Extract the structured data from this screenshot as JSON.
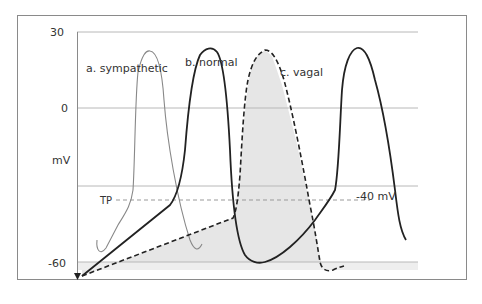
{
  "figure": {
    "y_axis": {
      "unit_label": "mV",
      "ticks": [
        "30",
        "0",
        "-60"
      ]
    },
    "reference_lines": {
      "threshold_label": "TP",
      "threshold_value_label": "-40 mV"
    },
    "curves": [
      {
        "id": "a",
        "label": "a. sympathetic",
        "style": "thin solid grey"
      },
      {
        "id": "b",
        "label": "b. normal",
        "style": "thick solid black"
      },
      {
        "id": "c",
        "label": "c. vagal",
        "style": "thick dashed black, shaded"
      }
    ],
    "colors": {
      "frame": "#8a8a8a",
      "grid": "#b8b8b8",
      "shade": "#e6e6e6",
      "curve_dark": "#222222",
      "curve_light": "#888888"
    }
  }
}
